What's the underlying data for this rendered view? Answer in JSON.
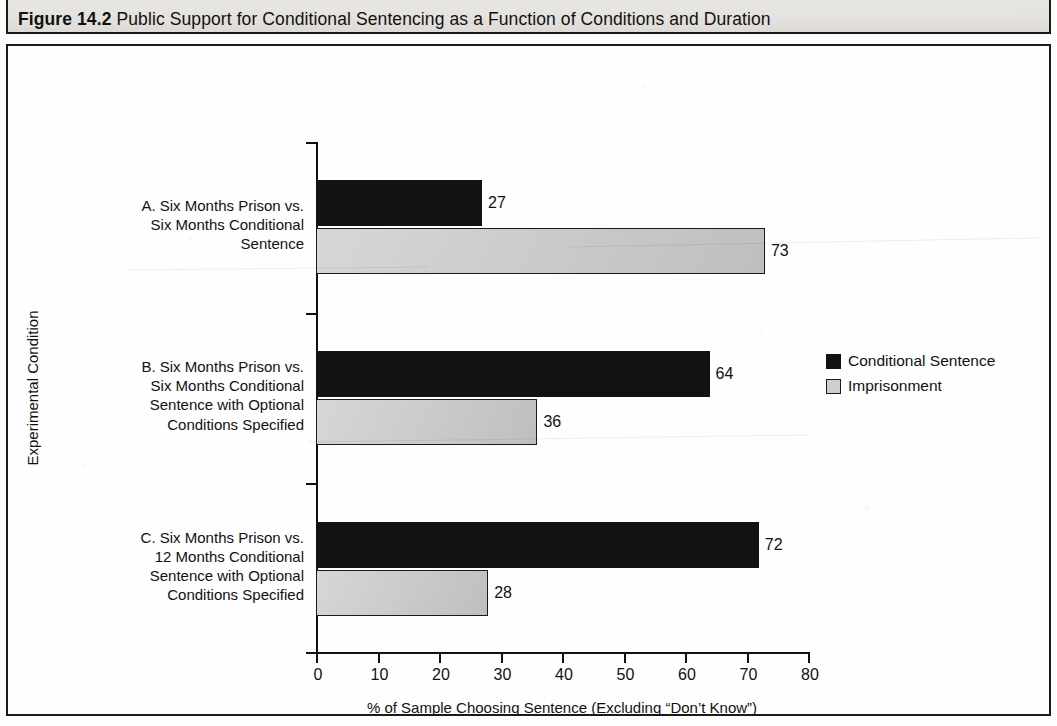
{
  "figure": {
    "number_label": "Figure 14.2",
    "title": "Public Support for Conditional Sentencing as a Function of Conditions and Duration"
  },
  "chart_data": {
    "type": "bar",
    "orientation": "horizontal",
    "title": "Public Support for Conditional Sentencing as a Function of Conditions and Duration",
    "xlabel": "% of Sample Choosing Sentence (Excluding “Don’t Know”)",
    "ylabel": "Experimental Condition",
    "xlim": [
      0,
      80
    ],
    "xticks": [
      0,
      10,
      20,
      30,
      40,
      50,
      60,
      70,
      80
    ],
    "xtick_labels": [
      "0",
      "10",
      "20",
      "30",
      "40",
      "50",
      "60",
      "70",
      "80"
    ],
    "grid": false,
    "legend_position": "right-middle",
    "categories": [
      "A. Six Months Prison vs. Six Months Conditional Sentence",
      "B. Six Months Prison vs. Six Months Conditional Sentence with Optional Conditions Specified",
      "C. Six Months Prison vs. 12 Months Conditional Sentence with Optional Conditions Specified"
    ],
    "category_lines": [
      [
        "A. Six Months Prison vs.",
        "Six Months Conditional",
        "Sentence"
      ],
      [
        "B. Six Months Prison vs.",
        "Six Months Conditional",
        "Sentence with Optional",
        "Conditions Specified"
      ],
      [
        "C. Six Months Prison vs.",
        "12 Months Conditional",
        "Sentence with Optional",
        "Conditions Specified"
      ]
    ],
    "series": [
      {
        "name": "Conditional Sentence",
        "color": "#121212",
        "values": [
          27,
          64,
          72
        ]
      },
      {
        "name": "Imprisonment",
        "color": "#c9c9c9",
        "values": [
          73,
          36,
          28
        ]
      }
    ],
    "value_labels": {
      "A": {
        "Conditional Sentence": "27",
        "Imprisonment": "73"
      },
      "B": {
        "Conditional Sentence": "64",
        "Imprisonment": "36"
      },
      "C": {
        "Conditional Sentence": "72",
        "Imprisonment": "28"
      }
    }
  },
  "legend": {
    "items": [
      {
        "label": "Conditional Sentence",
        "swatch": "black-filled-square"
      },
      {
        "label": "Imprisonment",
        "swatch": "grey-outlined-square"
      }
    ]
  },
  "colors": {
    "series_conditional": "#121212",
    "series_imprisonment": "#c9c9c9",
    "axis": "#111111",
    "frame": "#1a1a1a",
    "title_band_background": "#e6e4e1",
    "page_background": "#fdfdfc"
  }
}
